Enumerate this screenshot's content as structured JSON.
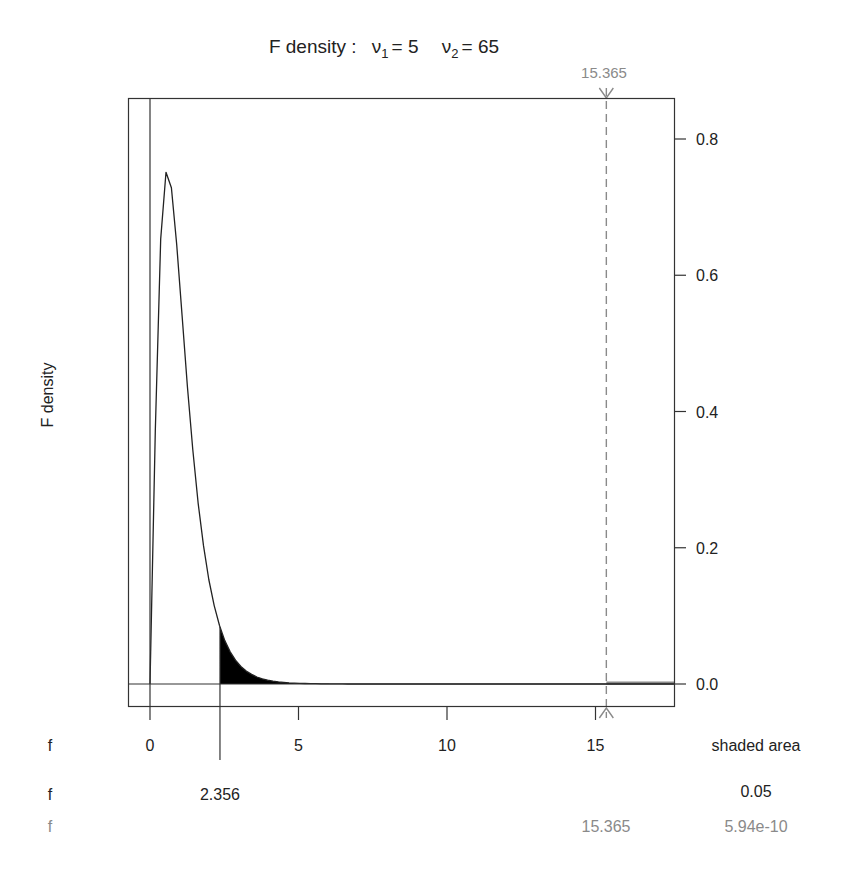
{
  "chart_data": {
    "type": "area",
    "title_parts": {
      "prefix": "F density :",
      "nu1_symbol": "ν",
      "nu1_sub": "1",
      "nu1_value": "= 5",
      "nu2_symbol": "ν",
      "nu2_sub": "2",
      "nu2_value": "= 65"
    },
    "distribution": "F",
    "df1": 5,
    "df2": 65,
    "xlabel": "f",
    "ylabel": "F density",
    "xlim": [
      -0.7,
      17.7
    ],
    "ylim": [
      -0.035,
      0.86
    ],
    "x_ticks": [
      0,
      5,
      10,
      15
    ],
    "x_tick_labels": [
      "0",
      "5",
      "10",
      "15"
    ],
    "y_ticks": [
      0.0,
      0.2,
      0.4,
      0.6,
      0.8
    ],
    "y_tick_labels": [
      "0.0",
      "0.2",
      "0.4",
      "0.6",
      "0.8"
    ],
    "y_axis_side": "right",
    "grid": false,
    "shaded_region": {
      "from": 2.356,
      "to": "upper",
      "area": 0.05,
      "color": "#000000"
    },
    "critical_value": 2.356,
    "observed_value": {
      "value": 15.365,
      "label": "15.365",
      "tail_area": "5.94e-10",
      "color": "#8a8a8a",
      "line_style": "dashed"
    },
    "curve_color": "#222222"
  },
  "table": {
    "header": {
      "row_label": "f",
      "right_label": "shaded area"
    },
    "rows": [
      {
        "row_label": "f",
        "f_value": "2.356",
        "area": "0.05",
        "color": "#222222"
      },
      {
        "row_label": "f",
        "f_value": "15.365",
        "area": "5.94e-10",
        "color": "#8a8a8a"
      }
    ]
  }
}
